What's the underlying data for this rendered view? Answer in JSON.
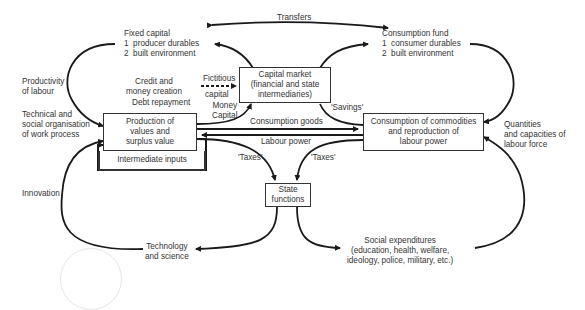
{
  "diagram": {
    "type": "flow-cycle",
    "stroke_color": "#1a1a1a",
    "text_color": "#333333",
    "background": "#ffffff",
    "boxes": {
      "production": "Production of\nvalues and\nsurplus value",
      "intermediate_inputs": "Intermediate inputs",
      "capital_market": "Capital market\n(financial and state\nintermediaries)",
      "consumption": "Consumption of commodities\nand reproduction of\nlabour power",
      "state_functions": "State\nfunctions"
    },
    "labels": {
      "transfers": "Transfers",
      "fixed_capital": "Fixed capital\n1  producer durables\n2  built environment",
      "consumption_fund": "Consumption fund\n1  consumer durables\n2  built environment",
      "productivity": "Productivity\nof labour",
      "credit": "Credit and\nmoney creation",
      "fictitious": "Fictitious",
      "fictitious_capital": "capital",
      "debt_repayment": "Debt repayment",
      "money_capital": "Money\nCapital",
      "savings": "'Savings'",
      "technical": "Technical and\nsocial organisation\nof work process",
      "consumption_goods": "Consumption goods",
      "labour_power": "Labour power",
      "quantities": "Quantities\nand capacities of\nlabour force",
      "taxes_left": "'Taxes'",
      "taxes_right": "'Taxes'",
      "innovation": "Innovation",
      "technology": "Technology\nand science",
      "social_expenditures": "Social expenditures\n(education, health, welfare,\nideology, police, military, etc.)"
    }
  }
}
